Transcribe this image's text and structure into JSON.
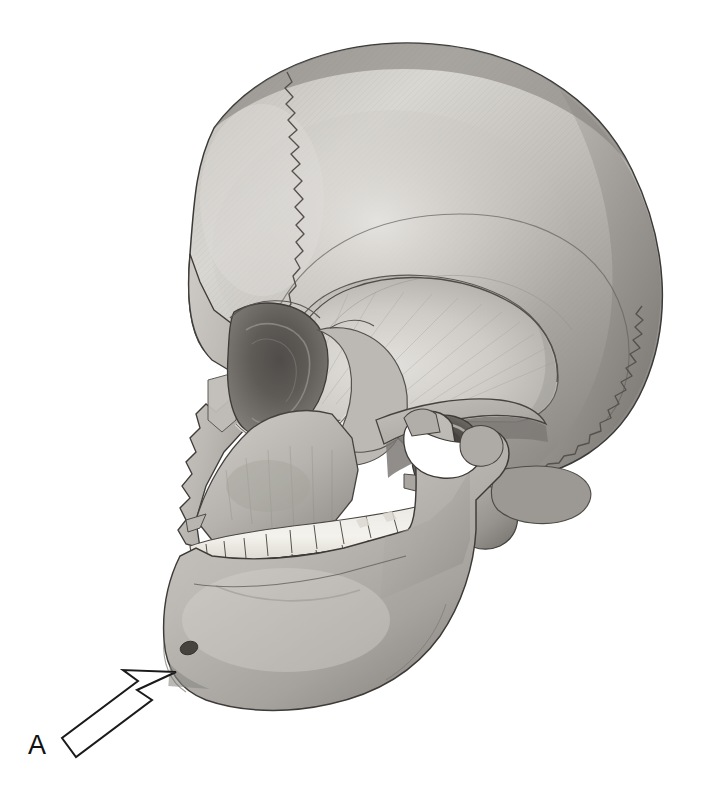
{
  "figure": {
    "type": "anatomical-illustration",
    "medium": "graphite pencil drawing",
    "background_color": "#ffffff",
    "orientation": "left lateral (facing left)"
  },
  "annotations": [
    {
      "id": "A",
      "label": "A",
      "marker": "outlined-arrow",
      "points_to": "mental protuberance of mandible",
      "label_position": {
        "x": 28,
        "y": 745
      },
      "arrow_tip": {
        "x": 176,
        "y": 672
      },
      "arrow_tail": {
        "x": 72,
        "y": 752
      },
      "arrow_fill": "#ffffff",
      "arrow_stroke": "#1a1a1a"
    }
  ],
  "structures": [
    {
      "name": "frontal-bone",
      "region": "cranium-anterior"
    },
    {
      "name": "parietal-bone",
      "region": "cranium-superior"
    },
    {
      "name": "occipital-bone",
      "region": "cranium-posterior"
    },
    {
      "name": "temporal-squama",
      "region": "cranium-lateral"
    },
    {
      "name": "coronal-suture",
      "region": "cranium-superior"
    },
    {
      "name": "lambdoid-suture",
      "region": "cranium-posterior"
    },
    {
      "name": "squamous-suture",
      "region": "cranium-lateral"
    },
    {
      "name": "orbit",
      "region": "face"
    },
    {
      "name": "nasal-bone",
      "region": "face"
    },
    {
      "name": "zygomatic-bone",
      "region": "face"
    },
    {
      "name": "zygomatic-arch",
      "region": "face"
    },
    {
      "name": "maxilla",
      "region": "face"
    },
    {
      "name": "mandible",
      "region": "face"
    },
    {
      "name": "mandibular-ramus",
      "region": "face"
    },
    {
      "name": "mandibular-angle",
      "region": "face"
    },
    {
      "name": "mental-foramen",
      "region": "mandible"
    },
    {
      "name": "mental-protuberance",
      "region": "mandible"
    },
    {
      "name": "external-acoustic-meatus",
      "region": "temporal"
    },
    {
      "name": "mastoid-process",
      "region": "temporal"
    },
    {
      "name": "styloid-process",
      "region": "temporal"
    },
    {
      "name": "upper-dental-arch",
      "region": "maxilla"
    },
    {
      "name": "lower-dental-arch",
      "region": "mandible"
    }
  ],
  "palette": {
    "bone_light": "#d8d6d2",
    "bone_mid": "#b3b0ab",
    "bone_shadow": "#8d8a86",
    "bone_deep_shadow": "#6c6966",
    "tooth": "#f2f0ea",
    "outline": "#3a3a38",
    "suture": "#55524e",
    "foramen": "#4a4744",
    "label": "#111111"
  }
}
